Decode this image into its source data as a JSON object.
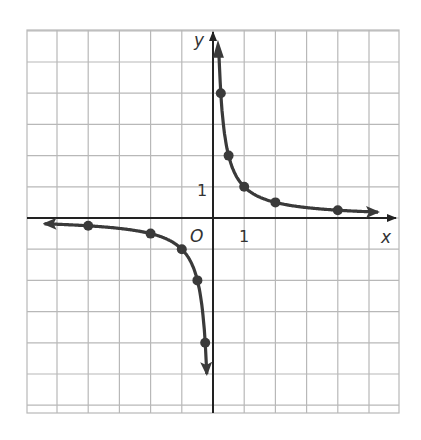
{
  "chart_data": {
    "type": "line",
    "title": "",
    "function": "y = 1/x",
    "xlabel": "x",
    "ylabel": "y",
    "origin_label": "O",
    "tick_labels": {
      "x": [
        "1"
      ],
      "y": [
        "1"
      ]
    },
    "xlim": [
      -6,
      6
    ],
    "ylim": [
      -6,
      6
    ],
    "grid": true,
    "series": [
      {
        "name": "branch-negative",
        "points": [
          [
            -5.5,
            -0.18
          ],
          [
            -4,
            -0.25
          ],
          [
            -2,
            -0.5
          ],
          [
            -1,
            -1
          ],
          [
            -0.5,
            -2
          ],
          [
            -0.25,
            -4
          ],
          [
            -0.18,
            -5.5
          ]
        ],
        "marked_points": [
          [
            -4,
            -0.25
          ],
          [
            -2,
            -0.5
          ],
          [
            -1,
            -1
          ],
          [
            -0.5,
            -2
          ],
          [
            -0.25,
            -4
          ]
        ]
      },
      {
        "name": "branch-positive",
        "points": [
          [
            0.18,
            5.5
          ],
          [
            0.25,
            4
          ],
          [
            0.5,
            2
          ],
          [
            1,
            1
          ],
          [
            2,
            0.5
          ],
          [
            4,
            0.25
          ],
          [
            5.3,
            0.19
          ]
        ],
        "marked_points": [
          [
            0.25,
            4
          ],
          [
            0.5,
            2
          ],
          [
            1,
            1
          ],
          [
            2,
            0.5
          ],
          [
            4,
            0.25
          ]
        ]
      }
    ],
    "colors": {
      "curve": "#3a3a3a",
      "axis": "#222222",
      "grid": "#b8b8b8"
    }
  }
}
